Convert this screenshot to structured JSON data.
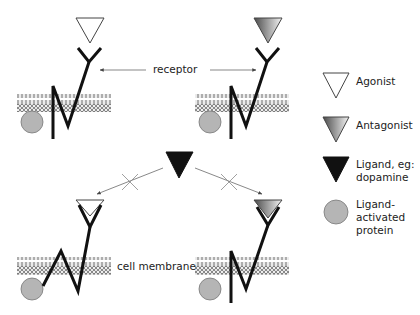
{
  "diagram": {
    "labels": {
      "receptor": "receptor",
      "cell_membrane": "cell membrane"
    },
    "panels": [
      {
        "position": "top-left",
        "ligand": "agonist",
        "state": "bound-above"
      },
      {
        "position": "top-right",
        "ligand": "antagonist",
        "state": "bound-above"
      },
      {
        "position": "bottom-left",
        "ligand": "agonist",
        "state": "docked",
        "dopamine_binding": "blocked"
      },
      {
        "position": "bottom-right",
        "ligand": "antagonist",
        "state": "docked",
        "dopamine_binding": "blocked"
      }
    ],
    "center_ligand": {
      "name": "dopamine",
      "arrows": [
        "to-bottom-left-blocked",
        "to-bottom-right-blocked"
      ]
    }
  },
  "legend": {
    "items": [
      {
        "icon": "agonist-triangle-icon",
        "label": "Agonist"
      },
      {
        "icon": "antagonist-triangle-icon",
        "label": "Antagonist"
      },
      {
        "icon": "ligand-triangle-icon",
        "label": "Ligand, eg: dopamine"
      },
      {
        "icon": "protein-circle-icon",
        "label": "Ligand-activated protein"
      }
    ]
  },
  "colors": {
    "line": "#111111",
    "protein_fill": "#b5b5b5",
    "arrow": "#555555",
    "cross": "#888888",
    "gradient_dark": "#555555",
    "gradient_light": "#f2f2f2"
  }
}
